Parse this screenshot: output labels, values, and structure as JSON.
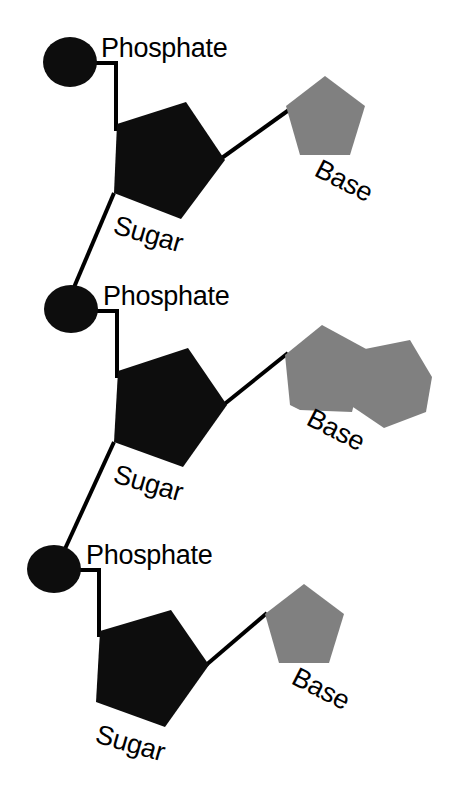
{
  "diagram": {
    "background_color": "#ffffff",
    "colors": {
      "phosphate": "#0d0d0d",
      "sugar": "#0d0d0d",
      "base": "#808080",
      "bond": "#000000",
      "text": "#000000"
    },
    "units": [
      {
        "id": "nucleotide-1",
        "phosphate_label": "Phosphate",
        "sugar_label": "Sugar",
        "base_label": "Base",
        "base_type": "pyrimidine",
        "base_shape": "pentagon"
      },
      {
        "id": "nucleotide-2",
        "phosphate_label": "Phosphate",
        "sugar_label": "Sugar",
        "base_label": "Base",
        "base_type": "purine",
        "base_shape": "fused-pentagon-hexagon"
      },
      {
        "id": "nucleotide-3",
        "phosphate_label": "Phosphate",
        "sugar_label": "Sugar",
        "base_label": "Base",
        "base_type": "pyrimidine",
        "base_shape": "pentagon"
      }
    ]
  }
}
